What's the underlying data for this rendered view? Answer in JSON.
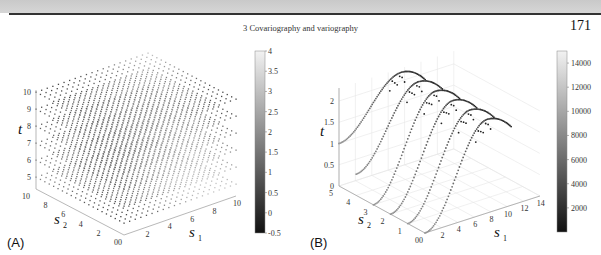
{
  "header": {
    "running_head": "3 Covariography and variography",
    "page_number": "171"
  },
  "chart_data": [
    {
      "panel": "(A)",
      "type": "scatter",
      "projection": "3d",
      "title": "",
      "xlabel": "s1",
      "ylabel": "s2",
      "zlabel": "t",
      "x_ticks": [
        "0",
        "2",
        "4",
        "6",
        "8",
        "10"
      ],
      "y_ticks": [
        "0",
        "2",
        "4",
        "6",
        "8",
        "10"
      ],
      "z_ticks": [
        "5",
        "6",
        "7",
        "8",
        "9",
        "10"
      ],
      "xlim": [
        0,
        10
      ],
      "ylim": [
        0,
        10
      ],
      "zlim": [
        4.5,
        10
      ],
      "description": "Regular 3D lattice of points on s1,s2 in [0,10] at t levels 5..10, grayscale colored",
      "t_levels": [
        5,
        6,
        7,
        8,
        9,
        10
      ],
      "colorbar": {
        "ticks": [
          "-0.5",
          "0",
          "0.5",
          "1",
          "1.5",
          "2",
          "2.5",
          "3",
          "3.5",
          "4"
        ],
        "range": [
          -0.5,
          4
        ],
        "colormap": "gray"
      },
      "grid": false
    },
    {
      "panel": "(B)",
      "type": "scatter",
      "projection": "3d",
      "title": "",
      "xlabel": "s1",
      "ylabel": "s2",
      "zlabel": "t",
      "x_ticks": [
        "0",
        "2",
        "4",
        "6",
        "8",
        "10",
        "12",
        "14"
      ],
      "y_ticks": [
        "0",
        "1",
        "2",
        "3",
        "4",
        "5"
      ],
      "z_ticks": [
        "0",
        "0.5",
        "1",
        "1.5",
        "2"
      ],
      "xlim": [
        0,
        14
      ],
      "ylim": [
        0,
        5
      ],
      "zlim": [
        0,
        2.3
      ],
      "description": "Six sigmoid-shaped curves of points (one per s2 level 0..5) rising from low t to a peak near t≈2.2",
      "series": [
        {
          "name": "s2=5",
          "t_start": 1.0,
          "t_peak": 2.2
        },
        {
          "name": "s2=4",
          "t_start": 0.5,
          "t_peak": 2.2
        },
        {
          "name": "s2=3",
          "t_start": 0.0,
          "t_peak": 2.2
        },
        {
          "name": "s2=2",
          "t_start": 0.0,
          "t_peak": 2.2
        },
        {
          "name": "s2=1",
          "t_start": 0.0,
          "t_peak": 2.2
        },
        {
          "name": "s2=0",
          "t_start": 0.0,
          "t_peak": 2.2
        }
      ],
      "colorbar": {
        "ticks": [
          "2000",
          "4000",
          "6000",
          "8000",
          "10000",
          "12000",
          "14000"
        ],
        "range": [
          0,
          15000
        ],
        "colormap": "gray"
      },
      "grid": true
    }
  ],
  "labels": {
    "panel_a": "(A)",
    "panel_b": "(B)",
    "t": "t",
    "s": "s",
    "sub1": "1",
    "sub2": "2"
  }
}
